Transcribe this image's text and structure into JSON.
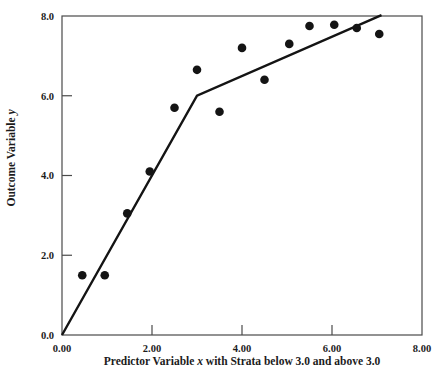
{
  "colors": {
    "ink": "#141414",
    "frame": "#4a4a4a",
    "background": "#ffffff"
  },
  "chart_data": {
    "type": "scatter",
    "title": "",
    "xlabel": "Predictor Variable x with Strata below 3.0 and above 3.0",
    "ylabel": "Outcome Variable y",
    "xlabel_parts": [
      {
        "text": "Predictor Variable ",
        "italic": false
      },
      {
        "text": "x",
        "italic": true
      },
      {
        "text": " with Strata below 3.0 and above 3.0",
        "italic": false
      }
    ],
    "ylabel_parts": [
      {
        "text": "Outcome Variable ",
        "italic": false
      },
      {
        "text": "y",
        "italic": true
      }
    ],
    "xlim": [
      0,
      8
    ],
    "ylim": [
      0,
      8
    ],
    "x_ticks": [
      0,
      2,
      4,
      6,
      8
    ],
    "x_tick_labels": [
      "0.00",
      "2.00",
      "4.00",
      "6.00",
      "8.00"
    ],
    "y_ticks": [
      0,
      2,
      4,
      6,
      8
    ],
    "y_tick_labels": [
      "0.0",
      "2.0",
      "4.0",
      "6.0",
      "8.0"
    ],
    "grid": false,
    "legend": null,
    "points": [
      [
        0.45,
        1.5
      ],
      [
        0.95,
        1.5
      ],
      [
        1.45,
        3.05
      ],
      [
        1.95,
        4.1
      ],
      [
        2.5,
        5.7
      ],
      [
        3.0,
        6.65
      ],
      [
        3.5,
        5.6
      ],
      [
        4.0,
        7.2
      ],
      [
        4.5,
        6.4
      ],
      [
        5.05,
        7.3
      ],
      [
        5.5,
        7.75
      ],
      [
        6.05,
        7.78
      ],
      [
        6.55,
        7.7
      ],
      [
        7.05,
        7.55
      ]
    ],
    "fit_line": {
      "breakpoint_x": 3.0,
      "vertices": [
        [
          0,
          0
        ],
        [
          3.0,
          6.0
        ],
        [
          7.1,
          8.02
        ]
      ]
    }
  }
}
